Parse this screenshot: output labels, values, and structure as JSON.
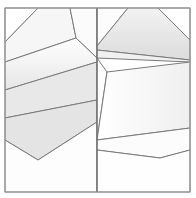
{
  "figure": {
    "width": 196,
    "height": 198,
    "background_color": "#ffffff",
    "stroke_color": "#7a7a7a",
    "frame_color": "#9a9a9a",
    "divider_color": "#6f6f6f"
  },
  "frame": {
    "name": "outer-frame",
    "left": 5,
    "top": 8,
    "right": 190,
    "bottom": 192,
    "corner_cut_top_left": true,
    "corner_cut_top_right": true,
    "corner_cut_bottom_left": false,
    "corner_cut_bottom_right": false,
    "outline_points": "5,8 190,8 190,192 5,192"
  },
  "divider": {
    "name": "center-vertical-divider",
    "x": 97,
    "y_top": 8,
    "y_bottom": 192
  },
  "palette": {
    "fill_lightest": "#ffffff",
    "fill_light": "#fafafa",
    "fill_mid_light": "#f2f2f2",
    "fill_mid": "#eaeaea",
    "fill_mid_dark": "#e2e2e2",
    "fill_dark": "#dadada",
    "fill_darkest": "#d2d2d2"
  },
  "panels": [
    {
      "name": "left-panel",
      "id": "panel-left",
      "bounds": {
        "x": 5,
        "y": 8,
        "width": 92,
        "height": 184
      },
      "facets": [
        {
          "name": "facet-left-corner-cut",
          "id": "L1",
          "points": "5,8 5,42 38,8",
          "fill": "#ffffff"
        },
        {
          "name": "facet-left-top-wedge",
          "id": "L2",
          "points": "38,8 5,42 5,62 76,38 70,8",
          "fill": "#f6f6f6"
        },
        {
          "name": "facet-left-top-right-sliver",
          "id": "L3",
          "points": "70,8 76,38 97,58 97,8",
          "fill": "#fbfbfb"
        },
        {
          "name": "facet-left-upper-band",
          "id": "L4",
          "points": "5,62 76,38 97,58 97,62 5,90",
          "fill": "#ededed"
        },
        {
          "name": "facet-left-mid-band",
          "id": "L5",
          "points": "5,90 97,62 97,100 5,118",
          "fill": "#e8e8e8"
        },
        {
          "name": "facet-left-lower-band",
          "id": "L6",
          "points": "5,118 97,100 97,122 38,160 5,140",
          "fill": "#e4e4e4"
        },
        {
          "name": "facet-left-bottom-wedge",
          "id": "L7",
          "points": "5,140 38,160 97,122 97,192 5,192",
          "fill": "#fdfdfd"
        }
      ]
    },
    {
      "name": "right-panel",
      "id": "panel-right",
      "bounds": {
        "x": 97,
        "y": 8,
        "width": 93,
        "height": 184
      },
      "facets": [
        {
          "name": "facet-right-corner-cut",
          "id": "R1",
          "points": "158,8 190,8 190,40",
          "fill": "#ffffff"
        },
        {
          "name": "facet-right-top-left-wedge",
          "id": "R2",
          "points": "97,8 128,8 97,46",
          "fill": "#fcfcfc"
        },
        {
          "name": "facet-right-top-cap",
          "id": "R3",
          "points": "128,8 158,8 190,40 190,60 97,50 97,46",
          "fill": "#e6e6e6"
        },
        {
          "name": "facet-right-upper-band",
          "id": "R4",
          "points": "97,50 190,60 190,62 97,58",
          "fill": "#f0f0f0"
        },
        {
          "name": "facet-right-left-sliver",
          "id": "R5",
          "points": "97,58 107,72 97,140",
          "fill": "#fdfdfd"
        },
        {
          "name": "facet-right-mid-diagonal",
          "id": "R6",
          "points": "107,72 190,62 190,128 97,140",
          "fill": "#fbfbfb"
        },
        {
          "name": "facet-right-lower-wedge",
          "id": "R7",
          "points": "97,140 190,128 190,150 160,158 97,150",
          "fill": "#fcfcfc"
        },
        {
          "name": "facet-right-bottom",
          "id": "R8",
          "points": "97,150 160,158 190,150 190,192 97,192",
          "fill": "#fefefe"
        }
      ]
    }
  ],
  "gradients": [
    {
      "name": "grad-left-vertical",
      "id": "gradL",
      "from": "#ffffff",
      "to": "#e0e0e0",
      "angle_deg": 90
    },
    {
      "name": "grad-right-vertical",
      "id": "gradR",
      "from": "#f4f4f4",
      "to": "#ffffff",
      "angle_deg": 90
    }
  ]
}
